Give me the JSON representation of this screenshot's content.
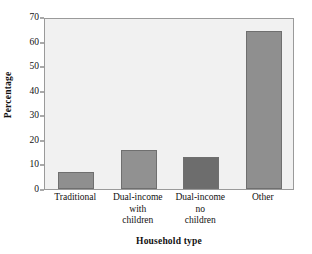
{
  "chart_data": {
    "type": "bar",
    "title": "",
    "subtitle": "",
    "xlabel": "Household type",
    "ylabel": "Percentage",
    "categories": [
      "Traditional",
      "Dual-income\nwith\nchildren",
      "Dual-income\nno\nchildren",
      "Other"
    ],
    "values": [
      7,
      16,
      13,
      64.5
    ],
    "ylim": [
      0,
      70
    ],
    "yticks": [
      0,
      10,
      20,
      30,
      40,
      50,
      60,
      70
    ],
    "ytick_labels": [
      "0",
      "10",
      "20",
      "30",
      "40",
      "50",
      "60",
      "70"
    ],
    "grid": false,
    "legend": "none",
    "bar_colors": [
      "#8f8f8f",
      "#919191",
      "#6d6d6d",
      "#8f8f8f"
    ],
    "bar_border_color": "#6f6f6f",
    "plot_background": "#f1f1f1",
    "plot_border_color": "#9a9a9a",
    "page_background": "#ffffff",
    "text_color": "#111111"
  }
}
